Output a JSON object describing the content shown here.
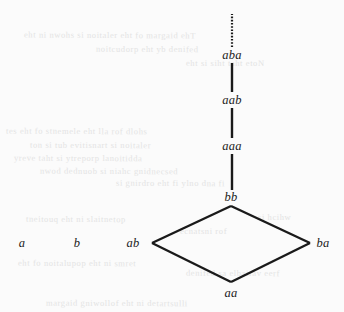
{
  "figure": {
    "background_color": "#fbfbfb",
    "ink_color": "#1a1a1a",
    "width": 344,
    "height": 312
  },
  "nodes": [
    {
      "id": "a",
      "label": "a",
      "x": 22,
      "y": 243
    },
    {
      "id": "b",
      "label": "b",
      "x": 77,
      "y": 243
    },
    {
      "id": "ab",
      "label": "ab",
      "x": 133,
      "y": 243
    },
    {
      "id": "ba",
      "label": "ba",
      "x": 323,
      "y": 243
    },
    {
      "id": "aa",
      "label": "aa",
      "x": 231,
      "y": 293
    },
    {
      "id": "bb",
      "label": "bb",
      "x": 231,
      "y": 197
    },
    {
      "id": "aaa",
      "label": "aaa",
      "x": 232,
      "y": 146
    },
    {
      "id": "aab",
      "label": "aab",
      "x": 232,
      "y": 100
    },
    {
      "id": "aba",
      "label": "aba",
      "x": 232,
      "y": 55
    }
  ],
  "vertices": {
    "diamond_top": {
      "x": 231,
      "y": 206
    },
    "diamond_left": {
      "x": 152,
      "y": 243
    },
    "diamond_right": {
      "x": 310,
      "y": 243
    },
    "diamond_bottom": {
      "x": 231,
      "y": 282
    }
  },
  "edges": [
    {
      "from": "ab",
      "to": "bb",
      "style": "solid",
      "x1": 152,
      "y1": 243,
      "x2": 231,
      "y2": 206
    },
    {
      "from": "bb",
      "to": "ba",
      "style": "solid",
      "x1": 231,
      "y1": 206,
      "x2": 310,
      "y2": 243
    },
    {
      "from": "ab",
      "to": "aa",
      "style": "solid",
      "x1": 152,
      "y1": 243,
      "x2": 231,
      "y2": 282
    },
    {
      "from": "aa",
      "to": "ba",
      "style": "solid",
      "x1": 231,
      "y1": 282,
      "x2": 310,
      "y2": 243
    },
    {
      "from": "bb",
      "to": "aaa",
      "style": "solid",
      "x1": 232,
      "y1": 190,
      "x2": 232,
      "y2": 154
    },
    {
      "from": "aaa",
      "to": "aab",
      "style": "solid",
      "x1": 232,
      "y1": 138,
      "x2": 232,
      "y2": 108
    },
    {
      "from": "aab",
      "to": "aba",
      "style": "solid",
      "x1": 232,
      "y1": 92,
      "x2": 232,
      "y2": 63
    },
    {
      "from": "aba",
      "to": "continuation",
      "style": "dotted",
      "x1": 232,
      "y1": 47,
      "x2": 232,
      "y2": 14
    }
  ],
  "bleed_through": [
    {
      "text": "eht ni nwohs si noitaler eht fo margaid ehT",
      "x": 24,
      "y": 30,
      "rotate": 0.3
    },
    {
      "text": "noitcudorp eht yb denifed",
      "x": 96,
      "y": 44,
      "rotate": 0.2
    },
    {
      "text": "eht si siht taht etoN",
      "x": 186,
      "y": 58,
      "rotate": 0.2
    },
    {
      "text": "tes eht fo stnemele eht lla rof dlohs",
      "x": 6,
      "y": 126,
      "rotate": 0.3
    },
    {
      "text": "ton si tub evitisnart si noitaler",
      "x": 30,
      "y": 140,
      "rotate": 0.2
    },
    {
      "text": "yreve taht si ytreporp lanoitidda",
      "x": 14,
      "y": 153,
      "rotate": 0.2
    },
    {
      "text": "nwod dednuob si niahc gnidnecsed",
      "x": 40,
      "y": 166,
      "rotate": 0.2
    },
    {
      "text": "si gnirdro eht fi ylno dna fi",
      "x": 116,
      "y": 178,
      "rotate": 0.2
    },
    {
      "text": "tneitouq eht ni slaitnetop",
      "x": 26,
      "y": 214,
      "rotate": 0.2
    },
    {
      "text": "ecnatsni rof",
      "x": 180,
      "y": 226,
      "rotate": 0.2
    },
    {
      "text": "si hcihw",
      "x": 258,
      "y": 212,
      "rotate": 0.2
    },
    {
      "text": "eht fo noitalupop eht ni smret",
      "x": 18,
      "y": 258,
      "rotate": 0.2
    },
    {
      "text": "denifed sa elbairav eerf",
      "x": 186,
      "y": 268,
      "rotate": 0.2
    },
    {
      "text": "margaid gniwollof eht ni detartsulli",
      "x": 46,
      "y": 298,
      "rotate": 0.2
    }
  ]
}
